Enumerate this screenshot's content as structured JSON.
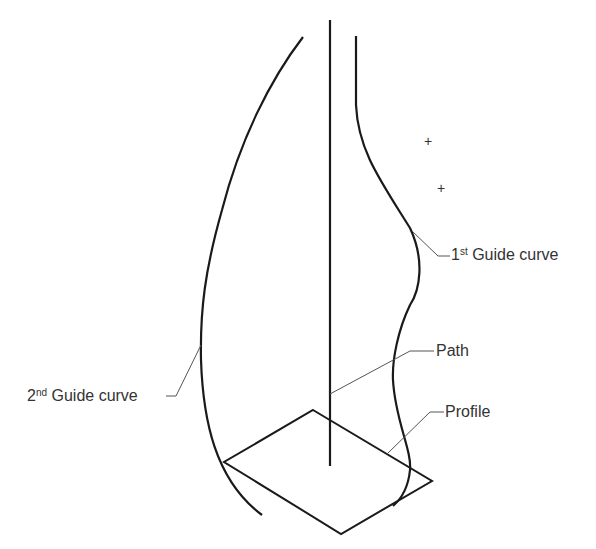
{
  "diagram": {
    "labels": {
      "first_guide": {
        "num": "1",
        "sup": "st",
        "text": "Guide curve"
      },
      "second_guide": {
        "num": "2",
        "sup": "nd",
        "text": "Guide curve"
      },
      "path": "Path",
      "profile": "Profile"
    },
    "markers": [
      "+",
      "+"
    ],
    "colors": {
      "stroke": "#1a1a1a",
      "leader": "#555555",
      "text": "#333333"
    }
  }
}
